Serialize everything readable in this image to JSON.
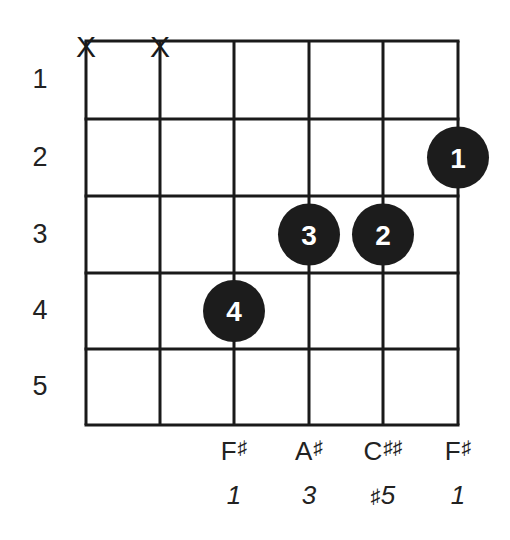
{
  "chord": {
    "strings": 6,
    "frets_shown": 5,
    "fret_numbers": [
      "1",
      "2",
      "3",
      "4",
      "5"
    ],
    "muted_strings": [
      1,
      2
    ],
    "muted_symbol": "X",
    "fingerings": [
      {
        "string": 3,
        "fret": 4,
        "finger": "4"
      },
      {
        "string": 4,
        "fret": 3,
        "finger": "3"
      },
      {
        "string": 5,
        "fret": 3,
        "finger": "2"
      },
      {
        "string": 6,
        "fret": 2,
        "finger": "1"
      }
    ],
    "notes": [
      {
        "string": 3,
        "letter": "F",
        "accidental": "♯",
        "interval_prefix": "",
        "interval": "1"
      },
      {
        "string": 4,
        "letter": "A",
        "accidental": "♯",
        "interval_prefix": "",
        "interval": "3"
      },
      {
        "string": 5,
        "letter": "C",
        "accidental": "♯♯",
        "interval_prefix": "♯",
        "interval": "5"
      },
      {
        "string": 6,
        "letter": "F",
        "accidental": "♯",
        "interval_prefix": "",
        "interval": "1"
      }
    ],
    "colors": {
      "line": "#1a1a1a",
      "dot": "#1c1c1c",
      "dot_text": "#ffffff",
      "text": "#222222"
    }
  }
}
